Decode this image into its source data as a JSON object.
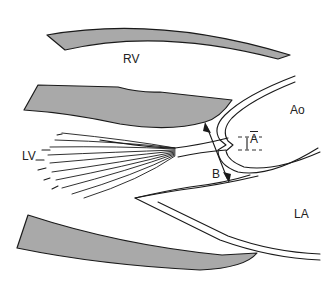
{
  "diagram": {
    "type": "cardiac long-axis schematic",
    "labels": {
      "rv": "RV",
      "lv": "LV",
      "ao": "Ao",
      "la": "LA",
      "measure_a": "A",
      "measure_b": "B"
    },
    "colors": {
      "wall_fill": "#a9a9a9",
      "stroke": "#1a1a1a",
      "background": "#ffffff"
    }
  }
}
